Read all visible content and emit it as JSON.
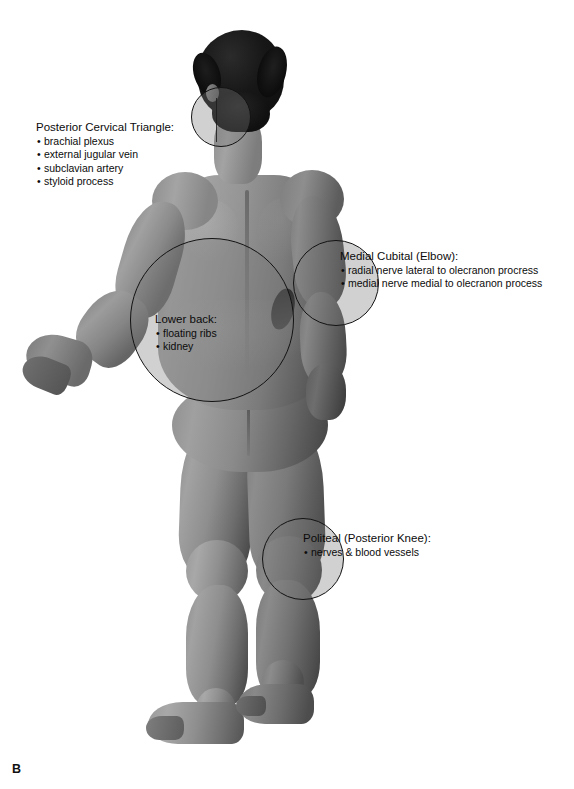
{
  "figure": {
    "panel_label": "B",
    "view": "posterior",
    "background_color": "#ffffff",
    "skin_tone": "#8e8e8e",
    "hair_color": "#141414",
    "outline_color": "#131313",
    "circle_fill": "rgba(120,120,120,0.34)"
  },
  "annotations": [
    {
      "id": "posterior-cervical-triangle",
      "title": "Posterior Cervical Triangle:",
      "items": [
        "brachial plexus",
        "external jugular vein",
        "subclavian artery",
        "styloid process"
      ],
      "label_x": 36,
      "label_y": 120,
      "circle": {
        "cx": 221,
        "cy": 117,
        "r": 30
      }
    },
    {
      "id": "medial-cubital",
      "title": "Medial Cubital (Elbow):",
      "items": [
        "radial nerve lateral to olecranon procress",
        "medial nerve medial to olecranon process"
      ],
      "label_x": 340,
      "label_y": 249,
      "circle": {
        "cx": 336,
        "cy": 283,
        "r": 43
      }
    },
    {
      "id": "lower-back",
      "title": "Lower back:",
      "items": [
        "floating ribs",
        "kidney"
      ],
      "label_x": 155,
      "label_y": 312,
      "circle": {
        "cx": 212,
        "cy": 320,
        "r": 82
      }
    },
    {
      "id": "popliteal",
      "title": "Politeal (Posterior Knee):",
      "items": [
        "nerves & blood vessels"
      ],
      "label_x": 303,
      "label_y": 531,
      "circle": {
        "cx": 303,
        "cy": 559,
        "r": 41
      }
    }
  ]
}
